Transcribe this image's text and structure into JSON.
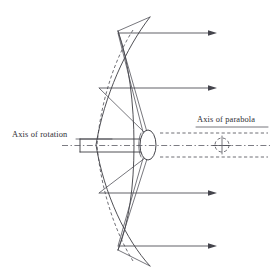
{
  "figure": {
    "background_color": "#ffffff",
    "line_color": "#3c3c42",
    "width": 277,
    "height": 274
  },
  "labels": {
    "axis_of_rotation": "Axis of rotation",
    "axis_of_parabola": "Axis of parabola"
  },
  "geometry": {
    "vertex": {
      "x": 87,
      "y": 145
    },
    "focus": {
      "x": 148,
      "y": 145
    },
    "rim_near_x": 131,
    "rim_far_x": 103,
    "dish_top_y": 17,
    "dish_bottom_y": 266,
    "hub_center": {
      "x": 148,
      "y": 145
    },
    "hub_rx": 8,
    "hub_ry": 15,
    "shaft_top_y": 139,
    "shaft_bottom_y": 152,
    "shaft_left_x": 80,
    "parabola_axis_marker": {
      "x": 222,
      "y": 145,
      "r": 7
    }
  },
  "rays": [
    {
      "name": "ray-1",
      "y": 33,
      "x_start": 118,
      "x_end": 216
    },
    {
      "name": "ray-2",
      "y": 88,
      "x_start": 101,
      "x_end": 216
    },
    {
      "name": "ray-3",
      "y": 193,
      "x_start": 101,
      "x_end": 216
    },
    {
      "name": "ray-4",
      "y": 246,
      "x_start": 118,
      "x_end": 216
    }
  ],
  "reflected_rays": [
    {
      "name": "reflected-ray-top",
      "from_x": 118,
      "from_y": 33,
      "to_x": 147,
      "to_y": 133
    },
    {
      "name": "reflected-ray-upper",
      "from_x": 101,
      "from_y": 88,
      "to_x": 146,
      "to_y": 134
    },
    {
      "name": "reflected-ray-lower",
      "from_x": 101,
      "from_y": 193,
      "to_x": 146,
      "to_y": 157
    },
    {
      "name": "reflected-ray-bottom",
      "from_x": 118,
      "from_y": 246,
      "to_x": 147,
      "to_y": 159
    }
  ],
  "axis_lines": {
    "rotation_axis_y": 145,
    "rotation_axis_x_start": 62,
    "rotation_axis_x_end": 270,
    "parabola_dashed_top_y": 133,
    "parabola_dashed_bottom_y": 157,
    "parabola_dashed_x_start": 160,
    "parabola_dashed_x_end": 268
  },
  "label_leaders": {
    "rotation_leader": {
      "x_start": 75,
      "x_end": 110,
      "y": 139
    },
    "parabola_leader": {
      "x_start": 196,
      "x_end": 268,
      "y": 126
    }
  }
}
